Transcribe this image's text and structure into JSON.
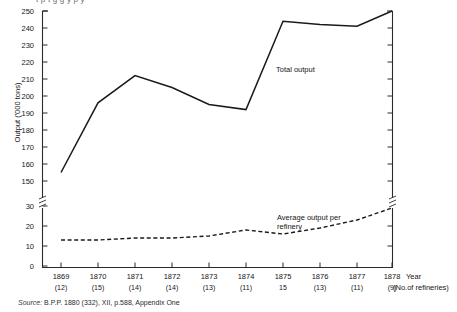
{
  "figure": {
    "cropped_title_line": "t   p           t                g                 g             y  p       y",
    "source_lead": "Source:",
    "source_text": "B.P.P. 1880 (332), XII, p.588, Appendix One"
  },
  "axes": {
    "y_title": "Output ('000 tons)",
    "x_title": "Year",
    "x_sub_title": "(No.of refineries)",
    "y_ticks_upper": [
      "250",
      "240",
      "230",
      "220",
      "210",
      "200",
      "190",
      "180",
      "170",
      "160",
      "150"
    ],
    "y_ticks_lower": [
      "30",
      "20",
      "10",
      "0"
    ],
    "axis_break": true
  },
  "annotations": {
    "total_output": "Total output",
    "average_output": "Average output per\nrefinery"
  },
  "chart_data": {
    "type": "line",
    "xlabel": "Year",
    "ylabel": "Output ('000 tons)",
    "grid": false,
    "legend": "annotated-inline",
    "axis_break": {
      "present": true,
      "lower_range": [
        0,
        30
      ],
      "upper_range": [
        150,
        250
      ]
    },
    "categories": [
      "1869",
      "1870",
      "1871",
      "1872",
      "1873",
      "1874",
      "1875",
      "1876",
      "1877",
      "1878"
    ],
    "refineries": [
      "(12)",
      "(15)",
      "(14)",
      "(14)",
      "(13)",
      "(11)",
      "15",
      "(13)",
      "(11)",
      "(9)"
    ],
    "series": [
      {
        "name": "Total output",
        "style": "solid",
        "scale": "upper",
        "values": [
          155,
          196,
          212,
          205,
          195,
          192,
          244,
          242,
          241,
          250
        ]
      },
      {
        "name": "Average output per refinery",
        "style": "dashed",
        "scale": "lower",
        "values": [
          13,
          13,
          14,
          14,
          15,
          18,
          16,
          19,
          23,
          29
        ]
      }
    ]
  },
  "colors": {
    "line": "#1a1a1a",
    "axis": "#2b2b2b",
    "text": "#151515",
    "background": "#ffffff"
  }
}
